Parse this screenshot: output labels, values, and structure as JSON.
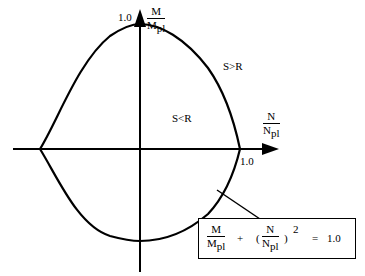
{
  "diagram": {
    "type": "interaction-curve",
    "y_axis": {
      "label_num": "M",
      "label_den": "M",
      "label_den_sub": "pl",
      "tick_label": "1.0"
    },
    "x_axis": {
      "label_num": "N",
      "label_den": "N",
      "label_den_sub": "pl",
      "tick_label": "1.0"
    },
    "regions": {
      "outside": "S>R",
      "inside": "S<R"
    },
    "formula": {
      "term1_num": "M",
      "term1_den": "M",
      "term1_den_sub": "pl",
      "plus": "+",
      "open_paren": "(",
      "term2_num": "N",
      "term2_den": "N",
      "term2_den_sub": "pl",
      "close_paren": ")",
      "exponent": "2",
      "equals": "=",
      "rhs": "1.0"
    },
    "colors": {
      "line": "#000000",
      "background": "#ffffff"
    }
  }
}
